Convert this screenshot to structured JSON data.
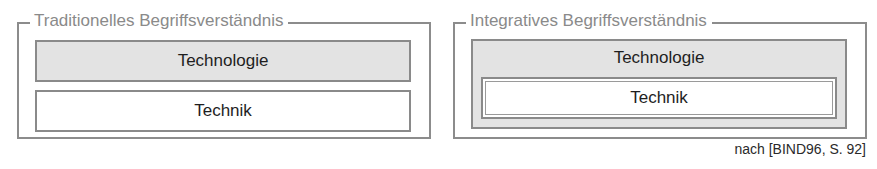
{
  "panels": [
    {
      "title": "Traditionelles Begriffsverständnis",
      "boxes": [
        {
          "label": "Technologie",
          "fill": "#e3e3e3"
        },
        {
          "label": "Technik",
          "fill": "#ffffff"
        }
      ]
    },
    {
      "title": "Integratives Begriffsverständnis",
      "boxes": [
        {
          "label": "Technologie",
          "fill": "#e3e3e3"
        },
        {
          "label": "Technik",
          "fill": "#ffffff"
        }
      ]
    }
  ],
  "source": "nach [BIND96, S. 92]"
}
